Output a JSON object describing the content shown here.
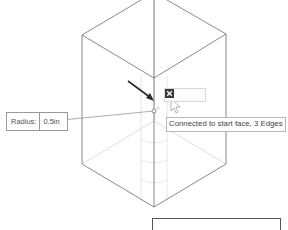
{
  "scene": {
    "description": "Isometric wireframe box with a hole feature preview",
    "edge_color": "#6b6b6b",
    "hidden_edge_color": "#d4d4d4",
    "arrow_color": "#2a2a2a"
  },
  "radius_input": {
    "label": "Radius:",
    "value": "0.5in"
  },
  "mini_toolbar": {
    "buttons": [
      {
        "name": "select-face-icon"
      },
      {
        "name": "solid-icon"
      },
      {
        "name": "close-icon"
      }
    ]
  },
  "tooltip": {
    "text": "Connected to start face, 3 Edges"
  }
}
